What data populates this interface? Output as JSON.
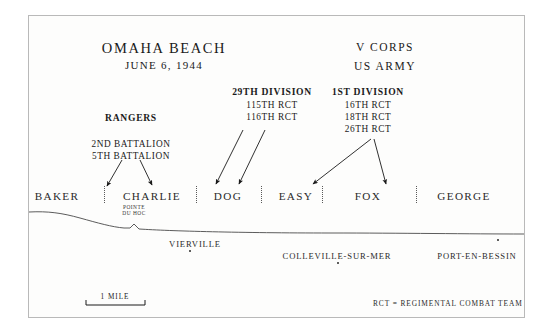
{
  "map": {
    "title": "OMAHA BEACH",
    "date": "JUNE 6, 1944",
    "corps": "V CORPS",
    "army": "US ARMY"
  },
  "units": {
    "rangers": {
      "name": "RANGERS",
      "elements": [
        "2ND  BATTALION",
        "5TH  BATTALION"
      ]
    },
    "div29": {
      "name": "29TH  DIVISION",
      "elements": [
        "115TH  RCT",
        "116TH RCT"
      ]
    },
    "div1": {
      "name": "1ST  DIVISION",
      "elements": [
        "16TH RCT",
        "18TH RCT",
        "26TH RCT"
      ]
    }
  },
  "sectors": [
    {
      "label": "BAKER",
      "x": 57
    },
    {
      "label": "CHARLIE",
      "x": 152
    },
    {
      "label": "DOG",
      "x": 228
    },
    {
      "label": "EASY",
      "x": 296
    },
    {
      "label": "FOX",
      "x": 368
    },
    {
      "label": "GEORGE",
      "x": 464
    }
  ],
  "landmarks": {
    "pointe_du_hoc": "POINTE\nDU HOC"
  },
  "towns": [
    {
      "name": "VIERVILLE",
      "x": 195,
      "y": 240,
      "dot_x": 189,
      "dot_y": 250
    },
    {
      "name": "COLLEVILLE-SUR-MER",
      "x": 337,
      "y": 252,
      "dot_x": 337,
      "dot_y": 262
    },
    {
      "name": "PORT-EN-BESSIN",
      "x": 477,
      "y": 252,
      "dot_x": 497,
      "dot_y": 239
    }
  ],
  "scale": {
    "label": "1 MILE"
  },
  "legend": {
    "note": "RCT = REGIMENTAL COMBAT TEAM"
  },
  "colors": {
    "ink": "#1a1a1a",
    "frame": "#b9b9b9",
    "coast": "#4a4a4a"
  }
}
